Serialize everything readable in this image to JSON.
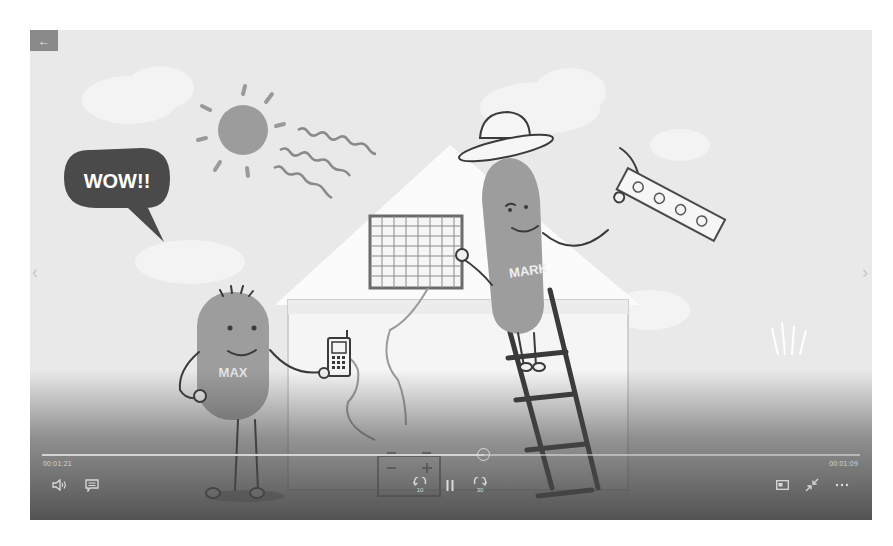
{
  "player": {
    "back_icon": "arrow-left-icon",
    "back_glyph": "←",
    "prev_glyph": "‹",
    "next_glyph": "›",
    "elapsed": "00:01:21",
    "remaining": "00:01:09",
    "progress": 0.54,
    "controls": {
      "volume": "volume-icon",
      "captions": "captions-icon",
      "skip_back": "skip-back-10-icon",
      "play_pause": "pause-icon",
      "skip_forward": "skip-forward-30-icon",
      "mini_view": "mini-view-icon",
      "fullscreen": "exit-fullscreen-icon",
      "more": "more-icon"
    },
    "skip_back_seconds": "10",
    "skip_forward_seconds": "30"
  },
  "scene": {
    "speech_bubble_text": "WOW!!",
    "character_left_name": "MAX",
    "character_right_name": "MARK",
    "colors": {
      "background": "#e9e9e9",
      "character": "#9a9a9a",
      "outline": "#3a3a3a",
      "bubble": "#4a4a4a"
    }
  }
}
